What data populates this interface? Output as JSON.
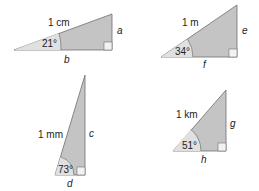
{
  "colors": {
    "fill_dark": "#c4c4c4",
    "fill_light": "#e0e0e0",
    "stroke": "#6e6e6e",
    "right_angle_fill": "#f2f2f2"
  },
  "triangles": [
    {
      "hypotenuse": "1 cm",
      "angle": "21°",
      "opposite": "a",
      "adjacent": "b"
    },
    {
      "hypotenuse": "1 m",
      "angle": "34°",
      "opposite": "e",
      "adjacent": "f"
    },
    {
      "hypotenuse": "1 mm",
      "angle": "73°",
      "opposite": "c",
      "adjacent": "d"
    },
    {
      "hypotenuse": "1 km",
      "angle": "51°",
      "opposite": "g",
      "adjacent": "h"
    }
  ]
}
